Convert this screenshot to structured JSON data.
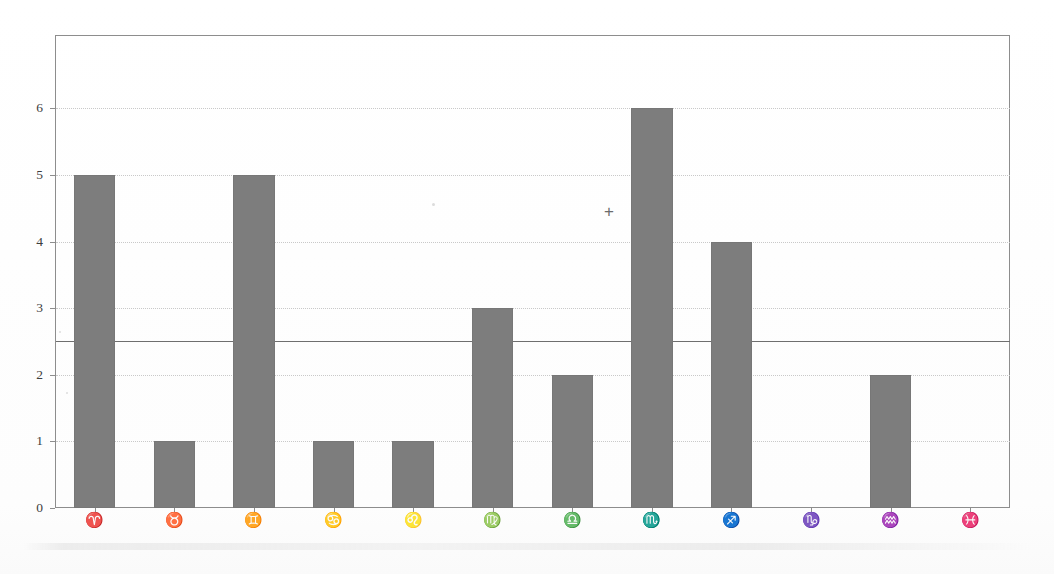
{
  "chart_data": {
    "type": "bar",
    "title": "",
    "subtitle": "",
    "xlabel": "",
    "ylabel": "",
    "categories": [
      "♈",
      "♉",
      "♊",
      "♋",
      "♌",
      "♍",
      "♎",
      "♏",
      "♐",
      "♑",
      "♒",
      "♓"
    ],
    "category_names": [
      "Aries",
      "Taurus",
      "Gemini",
      "Cancer",
      "Leo",
      "Virgo",
      "Libra",
      "Scorpio",
      "Sagittarius",
      "Capricorn",
      "Aquarius",
      "Pisces"
    ],
    "values": [
      5,
      1,
      5,
      1,
      1,
      3,
      2,
      6,
      4,
      0,
      2,
      0
    ],
    "ylim": [
      0,
      7.1
    ],
    "yticks": [
      0,
      1,
      2,
      3,
      4,
      5,
      6
    ],
    "ytick_labels": [
      "0",
      "1",
      "2",
      "3",
      "4",
      "5",
      "6"
    ],
    "grid": "horizontal-dotted",
    "gridline_values": [
      1,
      2,
      3,
      4,
      5,
      6
    ],
    "reference_line": {
      "value": 2.5,
      "style": "solid",
      "color": "#6f6f6f"
    },
    "annotations": [
      {
        "label": "+",
        "name": "plus-marker",
        "x_category": "♏",
        "x_offset_category": 7,
        "y": 4.45
      }
    ],
    "legend": "none",
    "bar_color": "#7d7d7d",
    "frame_color": "#8d8d8d",
    "gridline_color": "#c9c9c9",
    "background_color": "#fefefe"
  }
}
